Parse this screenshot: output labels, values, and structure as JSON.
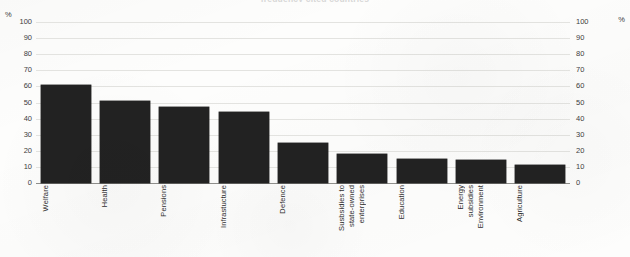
{
  "chart_data": {
    "type": "bar",
    "title": "",
    "xlabel": "",
    "ylabel": "%",
    "ylabel_right": "%",
    "ylim": [
      0,
      100
    ],
    "ytick_step": 10,
    "yticks": [
      0,
      10,
      20,
      30,
      40,
      50,
      60,
      70,
      80,
      90,
      100
    ],
    "grid": true,
    "legend": "none",
    "bar_color": "#222222",
    "categories": [
      "Welfare",
      "Health",
      "Pensions",
      "Infrastucture",
      "Defence",
      "Susbsidies to state-owned enterprises",
      "Education",
      "Energy subsidies Environment",
      "Agriculture"
    ],
    "category_lines": [
      [
        "Welfare"
      ],
      [
        "Health"
      ],
      [
        "Pensions"
      ],
      [
        "Infrastucture"
      ],
      [
        "Defence"
      ],
      [
        "Susbsidies to",
        "state-owned",
        "enterprises"
      ],
      [
        "Education"
      ],
      [
        "Energy",
        "subsidies",
        "Environment"
      ],
      [
        "Agriculture"
      ]
    ],
    "values": [
      61,
      51,
      47,
      44,
      25,
      18,
      15,
      14,
      11
    ]
  },
  "axes": {
    "unit_left": "%",
    "unit_right": "%"
  },
  "title": {
    "text": "frequency cited countries"
  }
}
